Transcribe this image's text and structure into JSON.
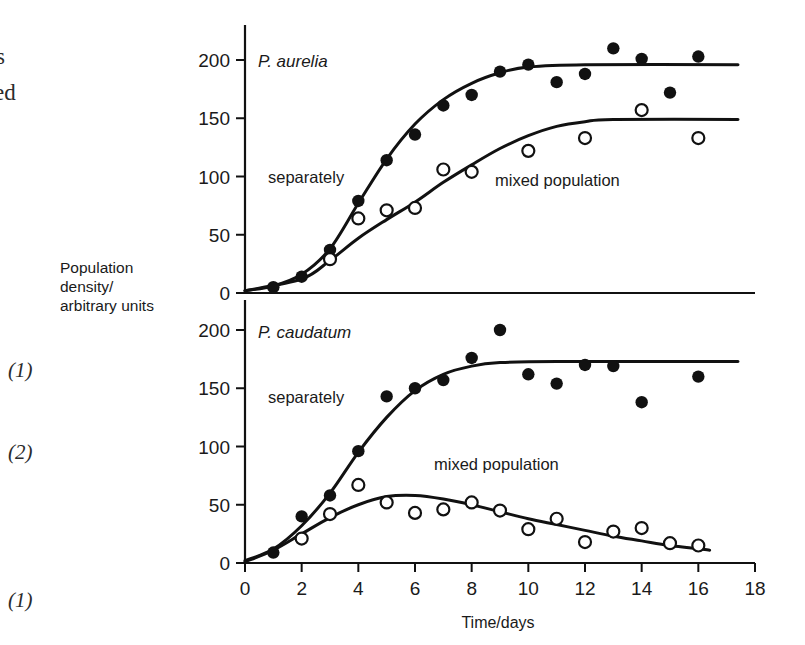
{
  "margin": {
    "fragment_top_1": "s",
    "fragment_top_2": "ed",
    "mark_1": "(1)",
    "mark_2": "(2)",
    "mark_3": "(1)"
  },
  "axis_caption": {
    "line1": "Population",
    "line2": "density/",
    "line3": "arbitrary units"
  },
  "colors": {
    "ink": "#111111",
    "background": "#ffffff"
  },
  "chart_data": [
    {
      "type": "scatter",
      "id": "p-aurelia",
      "title": "P. aurelia",
      "xlabel": "",
      "ylabel": "Population density/arbitrary units",
      "xlim": [
        0,
        18
      ],
      "ylim": [
        0,
        215
      ],
      "xticks": [
        0,
        2,
        4,
        6,
        8,
        10,
        12,
        14,
        16,
        18
      ],
      "yticks": [
        0,
        50,
        100,
        150,
        200
      ],
      "grid": false,
      "legend": "inline-annotations",
      "annotations": [
        "separately",
        "mixed population"
      ],
      "series": [
        {
          "name": "separately",
          "marker": "filled-circle",
          "points": [
            {
              "x": 1,
              "y": 5
            },
            {
              "x": 2,
              "y": 14
            },
            {
              "x": 3,
              "y": 37
            },
            {
              "x": 4,
              "y": 79
            },
            {
              "x": 5,
              "y": 114
            },
            {
              "x": 6,
              "y": 136
            },
            {
              "x": 7,
              "y": 161
            },
            {
              "x": 8,
              "y": 170
            },
            {
              "x": 9,
              "y": 190
            },
            {
              "x": 10,
              "y": 196
            },
            {
              "x": 11,
              "y": 181
            },
            {
              "x": 12,
              "y": 188
            },
            {
              "x": 13,
              "y": 210
            },
            {
              "x": 14,
              "y": 201
            },
            {
              "x": 15,
              "y": 172
            },
            {
              "x": 16,
              "y": 203
            }
          ],
          "fit": [
            {
              "x": 0,
              "y": 2
            },
            {
              "x": 1,
              "y": 6
            },
            {
              "x": 2,
              "y": 16
            },
            {
              "x": 3,
              "y": 38
            },
            {
              "x": 4,
              "y": 77
            },
            {
              "x": 5,
              "y": 115
            },
            {
              "x": 6,
              "y": 145
            },
            {
              "x": 7,
              "y": 166
            },
            {
              "x": 8,
              "y": 180
            },
            {
              "x": 9,
              "y": 189
            },
            {
              "x": 10,
              "y": 194
            },
            {
              "x": 12,
              "y": 196
            },
            {
              "x": 17.4,
              "y": 196
            }
          ]
        },
        {
          "name": "mixed population",
          "marker": "open-circle",
          "points": [
            {
              "x": 3,
              "y": 29
            },
            {
              "x": 4,
              "y": 64
            },
            {
              "x": 5,
              "y": 71
            },
            {
              "x": 6,
              "y": 73
            },
            {
              "x": 7,
              "y": 106
            },
            {
              "x": 8,
              "y": 104
            },
            {
              "x": 10,
              "y": 122
            },
            {
              "x": 12,
              "y": 133
            },
            {
              "x": 14,
              "y": 157
            },
            {
              "x": 16,
              "y": 133
            }
          ],
          "fit": [
            {
              "x": 0,
              "y": 2
            },
            {
              "x": 2,
              "y": 12
            },
            {
              "x": 3,
              "y": 28
            },
            {
              "x": 4,
              "y": 47
            },
            {
              "x": 5,
              "y": 63
            },
            {
              "x": 6,
              "y": 78
            },
            {
              "x": 7,
              "y": 95
            },
            {
              "x": 8,
              "y": 110
            },
            {
              "x": 9,
              "y": 124
            },
            {
              "x": 10,
              "y": 135
            },
            {
              "x": 11,
              "y": 143
            },
            {
              "x": 12,
              "y": 147
            },
            {
              "x": 13,
              "y": 149
            },
            {
              "x": 17.4,
              "y": 149
            }
          ]
        }
      ]
    },
    {
      "type": "scatter",
      "id": "p-caudatum",
      "title": "P. caudatum",
      "xlabel": "Time/days",
      "ylabel": "Population density/arbitrary units",
      "xlim": [
        0,
        18
      ],
      "ylim": [
        0,
        215
      ],
      "xticks": [
        0,
        2,
        4,
        6,
        8,
        10,
        12,
        14,
        16,
        18
      ],
      "yticks": [
        0,
        50,
        100,
        150,
        200
      ],
      "grid": false,
      "legend": "inline-annotations",
      "annotations": [
        "separately",
        "mixed population"
      ],
      "series": [
        {
          "name": "separately",
          "marker": "filled-circle",
          "points": [
            {
              "x": 1,
              "y": 9
            },
            {
              "x": 2,
              "y": 40
            },
            {
              "x": 3,
              "y": 58
            },
            {
              "x": 4,
              "y": 96
            },
            {
              "x": 5,
              "y": 143
            },
            {
              "x": 6,
              "y": 150
            },
            {
              "x": 7,
              "y": 157
            },
            {
              "x": 8,
              "y": 176
            },
            {
              "x": 9,
              "y": 200
            },
            {
              "x": 10,
              "y": 162
            },
            {
              "x": 11,
              "y": 154
            },
            {
              "x": 12,
              "y": 170
            },
            {
              "x": 13,
              "y": 169
            },
            {
              "x": 14,
              "y": 138
            },
            {
              "x": 16,
              "y": 160
            }
          ],
          "fit": [
            {
              "x": 0,
              "y": 2
            },
            {
              "x": 1,
              "y": 12
            },
            {
              "x": 2,
              "y": 32
            },
            {
              "x": 3,
              "y": 60
            },
            {
              "x": 4,
              "y": 95
            },
            {
              "x": 5,
              "y": 125
            },
            {
              "x": 6,
              "y": 148
            },
            {
              "x": 7,
              "y": 162
            },
            {
              "x": 8,
              "y": 169
            },
            {
              "x": 9,
              "y": 172
            },
            {
              "x": 11,
              "y": 173
            },
            {
              "x": 17.4,
              "y": 173
            }
          ]
        },
        {
          "name": "mixed population",
          "marker": "open-circle",
          "points": [
            {
              "x": 2,
              "y": 21
            },
            {
              "x": 3,
              "y": 42
            },
            {
              "x": 4,
              "y": 67
            },
            {
              "x": 5,
              "y": 52
            },
            {
              "x": 6,
              "y": 43
            },
            {
              "x": 7,
              "y": 46
            },
            {
              "x": 8,
              "y": 52
            },
            {
              "x": 9,
              "y": 45
            },
            {
              "x": 10,
              "y": 29
            },
            {
              "x": 11,
              "y": 38
            },
            {
              "x": 12,
              "y": 18
            },
            {
              "x": 13,
              "y": 27
            },
            {
              "x": 14,
              "y": 30
            },
            {
              "x": 15,
              "y": 17
            },
            {
              "x": 16,
              "y": 15
            }
          ],
          "fit": [
            {
              "x": 0,
              "y": 1
            },
            {
              "x": 1,
              "y": 11
            },
            {
              "x": 2,
              "y": 25
            },
            {
              "x": 3,
              "y": 39
            },
            {
              "x": 4,
              "y": 50
            },
            {
              "x": 5,
              "y": 57
            },
            {
              "x": 6,
              "y": 58
            },
            {
              "x": 7,
              "y": 55
            },
            {
              "x": 8,
              "y": 50
            },
            {
              "x": 9,
              "y": 44
            },
            {
              "x": 10,
              "y": 38
            },
            {
              "x": 11,
              "y": 33
            },
            {
              "x": 12,
              "y": 28
            },
            {
              "x": 13,
              "y": 23
            },
            {
              "x": 14,
              "y": 19
            },
            {
              "x": 15,
              "y": 15
            },
            {
              "x": 16.4,
              "y": 11
            }
          ]
        }
      ]
    }
  ]
}
